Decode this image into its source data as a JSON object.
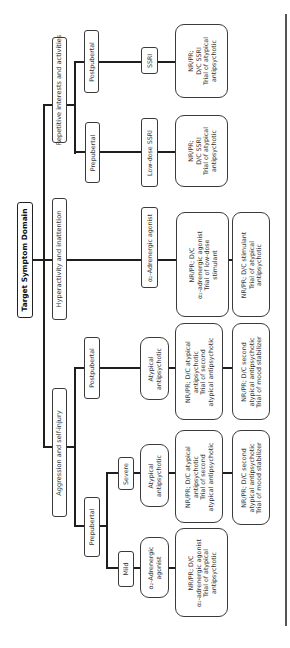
{
  "diagram": {
    "root": {
      "label": "Target Symptom Domain"
    },
    "domains": [
      {
        "label": "Repetitive interests and activities",
        "branches": [
          {
            "label": "Postpubertal",
            "treatment": "SSRI",
            "next_step": "NR/PR;\nD/C SSRI\nTrial of atypical\nantipsychotic"
          },
          {
            "label": "Prepubertal",
            "treatment": "Low-dose SSRI",
            "next_step": "NR/PR;\nD/C SSRI\nTrial of atypical\nantipsychotic"
          }
        ]
      },
      {
        "label": "Hyperactivity and inattention",
        "treatment": "α₂-Adrenergic agonist",
        "next_step": "NR/PR; D/C\nα₂-adrenergic agonist\nTrial of low-dose\nstimulant",
        "third_step": "NR/PR; D/C stimulant\nTrial of atypical\nantipsychotic"
      },
      {
        "label": "Aggression and self-injury",
        "branches": [
          {
            "label": "Postpubertal",
            "treatment": "Atypical\nantipsychotic",
            "next_step": "NR/PR; D/C atypical\nantipsychotic\nTrial of second\natypical antipsychotic",
            "third_step": "NR/PR; D/C second\natypical antipsychotic\nTrial of mood stabilizer"
          },
          {
            "label": "Prepubertal",
            "sub_branches": [
              {
                "label": "Severe",
                "treatment": "Atypical\nantipsychotic",
                "next_step": "NR/PR; D/C atypical\nantipsychotic\nTrial of second\natypical antipsychotic",
                "third_step": "NR/PR; D/C second\natypical antipsychotic\nTrial of mood stabilizer"
              },
              {
                "label": "Mild",
                "treatment": "α₂-Adrenergic\nagonist",
                "next_step": "NR/PR; D/C\nα₂-adrenergic agonist\nTrial of atypical\nantipsychotic"
              }
            ]
          }
        ]
      }
    ]
  },
  "colors": {
    "line": "#1e1e1e",
    "box_border": "#3a3a3a",
    "text": "#333333",
    "background": "#ffffff"
  }
}
